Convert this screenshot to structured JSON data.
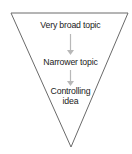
{
  "diagram": {
    "type": "inverted-triangle-funnel",
    "levels": [
      {
        "label": "Very broad topic"
      },
      {
        "label": "Narrower topic"
      },
      {
        "label_line1": "Controlling",
        "label_line2": "idea"
      }
    ],
    "colors": {
      "outline": "#6a6a6a",
      "arrow": "#b8b8b8",
      "text": "#222222"
    }
  }
}
